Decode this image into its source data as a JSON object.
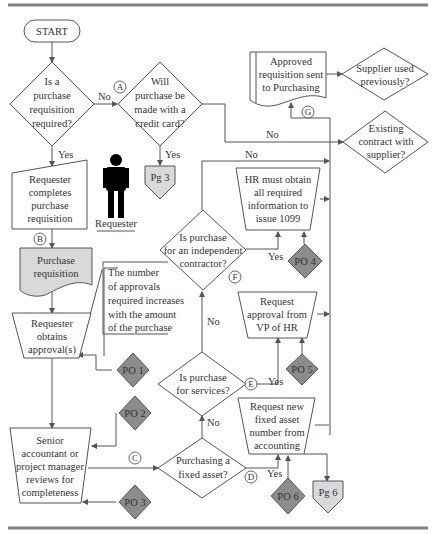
{
  "diagram": {
    "type": "flowchart",
    "colors": {
      "line": "#555555",
      "connector_shade": "#d9d9d9",
      "control_shade": "#8c8c8c",
      "rule": "#808080",
      "person": "#000000"
    },
    "start": {
      "label": "START"
    },
    "decisions": {
      "req_required": [
        "Is a",
        "purchase",
        "requisition",
        "required?"
      ],
      "credit_card": [
        "Will",
        "purchase be",
        "made with a",
        "credit card?"
      ],
      "independent_contractor": [
        "Is purchase",
        "for an independent",
        "contractor?"
      ],
      "services": [
        "Is purchase",
        "for services?"
      ],
      "fixed_asset": [
        "Purchasing a",
        "fixed asset?"
      ],
      "supplier_used": [
        "Supplier used",
        "previously?"
      ],
      "existing_contract": [
        "Existing",
        "contract with",
        "supplier?"
      ]
    },
    "processes": {
      "requester_completes": [
        "Requester",
        "completes",
        "purchase",
        "requisition"
      ],
      "requester_obtains": [
        "Requester",
        "obtains",
        "approval(s)"
      ],
      "senior_review": [
        "Senior",
        "accountant or",
        "project manager",
        "reviews for",
        "completeness"
      ],
      "hr_1099": [
        "HR must obtain",
        "all required",
        "information to",
        "issue 1099"
      ],
      "vp_hr": [
        "Request",
        "approval from",
        "VP of HR"
      ],
      "fixed_asset_number": [
        "Request new",
        "fixed asset",
        "number from",
        "accounting"
      ]
    },
    "documents": {
      "purchase_requisition": [
        "Purchase",
        "requisition"
      ],
      "approved_sent": [
        "Approved",
        "requisition sent",
        "to Purchasing"
      ]
    },
    "annotation": [
      "The number",
      "of approvals",
      "required increases",
      "with the amount",
      "of the purchase"
    ],
    "offpage": {
      "pg3": "Pg 3",
      "pg6": "Pg 6"
    },
    "controls": {
      "po1": "PO 1",
      "po2": "PO 2",
      "po3": "PO 3",
      "po4": "PO 4",
      "po5": "PO 5",
      "po6": "PO 6"
    },
    "markers": {
      "a": "A",
      "b": "B",
      "c": "C",
      "d": "D",
      "e": "E",
      "f": "F",
      "g": "G"
    },
    "edge_labels": {
      "no": "No",
      "yes": "Yes"
    },
    "actor": {
      "label": "Requester"
    }
  }
}
